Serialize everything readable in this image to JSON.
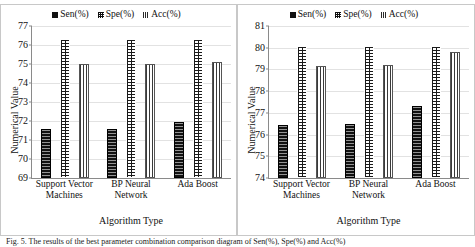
{
  "figure": {
    "caption": "Fig. 5.  The results of the best parameter combination comparison diagram of Sen(%), Spe(%) and Acc(%)"
  },
  "legend": {
    "items": [
      {
        "label": "Sen(%)",
        "icon": "legend-swatch-solid",
        "color": "#111111"
      },
      {
        "label": "Spe(%)",
        "icon": "legend-swatch-dotted",
        "color": "#111111"
      },
      {
        "label": "Acc(%)",
        "icon": "legend-swatch-striped",
        "color": "#3a3a3a"
      }
    ]
  },
  "chart_data": [
    {
      "id": "left-chart",
      "type": "bar",
      "title": "",
      "xlabel": "Algorithm Type",
      "ylabel": "Numerical Value",
      "categories": [
        "Support Vector Machines",
        "BP Neural Network",
        "Ada Boost"
      ],
      "series": [
        {
          "name": "Sen(%)",
          "values": [
            71.6,
            71.6,
            71.95
          ]
        },
        {
          "name": "Spe(%)",
          "values": [
            76.3,
            76.3,
            76.3
          ]
        },
        {
          "name": "Acc(%)",
          "values": [
            75.0,
            75.0,
            75.1
          ]
        }
      ],
      "ylim": [
        69,
        77
      ],
      "yticks": [
        69,
        70,
        71,
        72,
        73,
        74,
        75,
        76,
        77
      ],
      "grid": true,
      "legend_position": "top-center"
    },
    {
      "id": "right-chart",
      "type": "bar",
      "title": "",
      "xlabel": "Algorithm Type",
      "ylabel": "Numerical Value",
      "categories": [
        "Support Vector Machines",
        "BP Neural Network",
        "Ada Boost"
      ],
      "series": [
        {
          "name": "Sen(%)",
          "values": [
            76.45,
            76.5,
            77.3
          ]
        },
        {
          "name": "Spe(%)",
          "values": [
            80.1,
            80.1,
            80.1
          ]
        },
        {
          "name": "Acc(%)",
          "values": [
            79.15,
            79.2,
            79.8
          ]
        }
      ],
      "ylim": [
        74,
        81
      ],
      "yticks": [
        74,
        75,
        76,
        77,
        78,
        79,
        80,
        81
      ],
      "grid": true,
      "legend_position": "top-center"
    }
  ]
}
